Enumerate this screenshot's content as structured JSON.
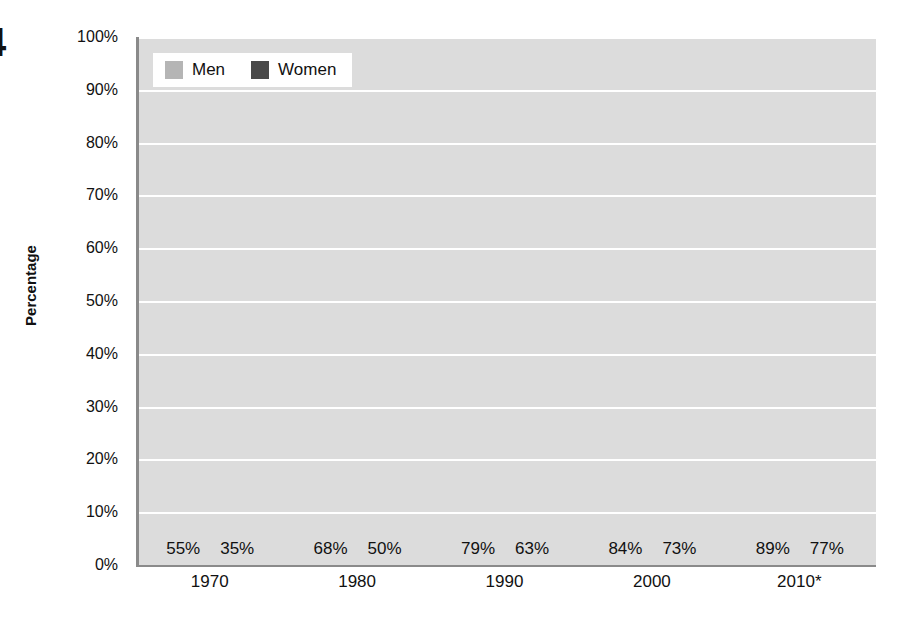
{
  "figure_number_fragment": "4",
  "chart_data": {
    "type": "bar",
    "title": "",
    "xlabel": "",
    "ylabel": "Percentage",
    "ylim": [
      0,
      100
    ],
    "ytick_labels": [
      "100%",
      "90%",
      "80%",
      "70%",
      "60%",
      "50%",
      "40%",
      "30%",
      "20%",
      "10%",
      "0%"
    ],
    "ytick_values": [
      100,
      90,
      80,
      70,
      60,
      50,
      40,
      30,
      20,
      10,
      0
    ],
    "categories": [
      "1970",
      "1980",
      "1990",
      "2000",
      "2010*"
    ],
    "series": [
      {
        "name": "Men",
        "color": "#b5b5b5",
        "values": [
          55,
          68,
          79,
          84,
          89
        ],
        "labels": [
          "55%",
          "68%",
          "79%",
          "84%",
          "89%"
        ]
      },
      {
        "name": "Women",
        "color": "#4a4a4a",
        "values": [
          35,
          50,
          63,
          73,
          77
        ],
        "labels": [
          "35%",
          "50%",
          "63%",
          "73%",
          "77%"
        ]
      }
    ],
    "legend": {
      "position": "top-left",
      "entries": [
        {
          "label": "Men",
          "color": "#b5b5b5"
        },
        {
          "label": "Women",
          "color": "#4a4a4a"
        }
      ]
    },
    "grid": {
      "horizontal": true,
      "vertical": false,
      "color": "#ffffff"
    },
    "plot_background": "#dcdcdc",
    "axis_color": "#8a8a8a"
  }
}
